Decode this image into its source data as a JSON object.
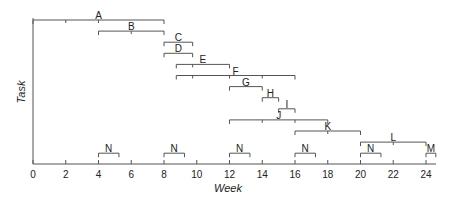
{
  "chart_data": {
    "type": "gantt",
    "title": "",
    "xlabel": "Week",
    "ylabel": "Task",
    "xlim": [
      0,
      24.6
    ],
    "xticks": [
      0,
      2,
      4,
      6,
      8,
      10,
      12,
      14,
      16,
      18,
      20,
      22,
      24
    ],
    "grid": false,
    "legend": null,
    "tasks": [
      {
        "name": "A",
        "row": 0,
        "start": 0,
        "end": 8,
        "ticks": [
          2,
          4
        ]
      },
      {
        "name": "B",
        "row": 1,
        "start": 4,
        "end": 8,
        "ticks": [
          6
        ]
      },
      {
        "name": "C",
        "row": 2,
        "start": 8,
        "end": 9.75,
        "ticks": []
      },
      {
        "name": "D",
        "row": 3,
        "start": 8,
        "end": 9.75,
        "ticks": []
      },
      {
        "name": "E",
        "row": 4,
        "start": 8.75,
        "end": 12,
        "ticks": [
          9.75
        ]
      },
      {
        "name": "F",
        "row": 5,
        "start": 8.75,
        "end": 16,
        "ticks": [
          9.75,
          12,
          14
        ]
      },
      {
        "name": "G",
        "row": 6,
        "start": 12,
        "end": 14,
        "ticks": []
      },
      {
        "name": "H",
        "row": 7,
        "start": 14,
        "end": 15,
        "ticks": []
      },
      {
        "name": "I",
        "row": 8,
        "start": 15,
        "end": 16,
        "ticks": []
      },
      {
        "name": "J",
        "row": 9,
        "start": 12,
        "end": 18,
        "ticks": [
          14,
          16
        ]
      },
      {
        "name": "K",
        "row": 10,
        "start": 16,
        "end": 20,
        "ticks": [
          18
        ]
      },
      {
        "name": "L",
        "row": 11,
        "start": 20,
        "end": 24,
        "ticks": [
          22
        ]
      },
      {
        "name": "N",
        "row": 12,
        "start": 4,
        "end": 5.25,
        "ticks": []
      },
      {
        "name": "N",
        "row": 12,
        "start": 8,
        "end": 9.25,
        "ticks": []
      },
      {
        "name": "N",
        "row": 12,
        "start": 12,
        "end": 13.25,
        "ticks": []
      },
      {
        "name": "N",
        "row": 12,
        "start": 16,
        "end": 17.25,
        "ticks": []
      },
      {
        "name": "N",
        "row": 12,
        "start": 20,
        "end": 21.25,
        "ticks": []
      },
      {
        "name": "M",
        "row": 12,
        "start": 24,
        "end": 24.6,
        "ticks": []
      }
    ]
  },
  "axes": {
    "x_title": "Week",
    "y_title": "Task"
  }
}
